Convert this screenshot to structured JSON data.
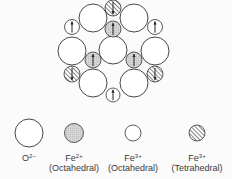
{
  "diagram": {
    "colors": {
      "stroke": "#333333",
      "oxygen_fill": "#ffffff",
      "fe2_oct_fill": "#d4d4d4",
      "fe3_oct_fill": "#ffffff",
      "fe3_tet_fill": "#ffffff",
      "hatch": "#444444",
      "arrow": "#222222"
    },
    "circles": [
      {
        "type": "fe3_tet",
        "cx": 113,
        "cy": 8,
        "r": 8,
        "arrow": "down"
      },
      {
        "type": "oxygen",
        "cx": 93,
        "cy": 18,
        "r": 14
      },
      {
        "type": "oxygen",
        "cx": 134,
        "cy": 18,
        "r": 14
      },
      {
        "type": "fe3_oct",
        "cx": 72,
        "cy": 27,
        "r": 7.5,
        "arrow": "up"
      },
      {
        "type": "fe2_oct",
        "cx": 113,
        "cy": 29,
        "r": 8,
        "arrow": "up"
      },
      {
        "type": "fe3_oct",
        "cx": 155,
        "cy": 27,
        "r": 7.5,
        "arrow": "up"
      },
      {
        "type": "oxygen",
        "cx": 72,
        "cy": 51,
        "r": 14
      },
      {
        "type": "oxygen",
        "cx": 113,
        "cy": 50,
        "r": 14
      },
      {
        "type": "oxygen",
        "cx": 155,
        "cy": 51,
        "r": 14
      },
      {
        "type": "fe2_oct",
        "cx": 93,
        "cy": 60,
        "r": 8,
        "arrow": "up"
      },
      {
        "type": "fe2_oct",
        "cx": 134,
        "cy": 60,
        "r": 8,
        "arrow": "up"
      },
      {
        "type": "fe3_tet",
        "cx": 72,
        "cy": 74,
        "r": 8,
        "arrow": "down"
      },
      {
        "type": "fe3_tet",
        "cx": 155,
        "cy": 74,
        "r": 8,
        "arrow": "down"
      },
      {
        "type": "oxygen",
        "cx": 93,
        "cy": 83,
        "r": 14
      },
      {
        "type": "oxygen",
        "cx": 134,
        "cy": 83,
        "r": 14
      },
      {
        "type": "fe3_oct",
        "cx": 113,
        "cy": 95,
        "r": 7,
        "arrow": "up"
      }
    ]
  },
  "legend": [
    {
      "key": "oxygen",
      "symbol": "O",
      "charge": "2−",
      "site": "",
      "cx": 29,
      "cy": 133,
      "r": 14
    },
    {
      "key": "fe2_oct",
      "symbol": "Fe",
      "charge": "2+",
      "site": "(Octahedral)",
      "cx": 74,
      "cy": 133,
      "r": 9.5
    },
    {
      "key": "fe3_oct",
      "symbol": "Fe",
      "charge": "3+",
      "site": "(Octahedral)",
      "cx": 133,
      "cy": 133,
      "r": 8
    },
    {
      "key": "fe3_tet",
      "symbol": "Fe",
      "charge": "3+",
      "site": "(Tetrahedral)",
      "cx": 197,
      "cy": 133,
      "r": 8
    }
  ]
}
